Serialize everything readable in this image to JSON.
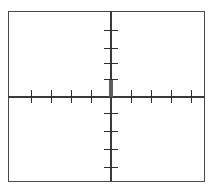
{
  "figure": {
    "kind": "cartesian-coordinate-plane",
    "width": 214,
    "height": 191,
    "background_color": "#ffffff",
    "frame_color": "#4a4a4a",
    "axis_color": "#3a3a3a",
    "tick_color": "#2e2e2e",
    "emphasis_color": "#5d5d5d",
    "title": "",
    "xlabel": "",
    "ylabel": ""
  },
  "chart_data": {
    "type": "scatter",
    "title": "",
    "subtitle": "",
    "xlabel": "",
    "ylabel": "",
    "grid": false,
    "legend": null,
    "legend_position": "none",
    "xlim": [
      -5,
      5
    ],
    "ylim": [
      -5,
      5
    ],
    "x_ticks": [
      -4,
      -3,
      -2,
      -1,
      1,
      2,
      3,
      4
    ],
    "y_ticks": [
      -4,
      -3,
      -2,
      -1,
      1,
      2,
      3,
      4
    ],
    "x_tick_labels": [
      "",
      "",
      "",
      "",
      "",
      "",
      "",
      ""
    ],
    "y_tick_labels": [
      "",
      "",
      "",
      "",
      "",
      "",
      "",
      ""
    ],
    "series": [
      {
        "name": "segment",
        "x": [
          0,
          0
        ],
        "y": [
          0,
          0.9
        ]
      }
    ],
    "annotations": [
      {
        "text": "",
        "x": 0,
        "y": 0.45,
        "note": "thickened vertical segment on positive y-axis from origin"
      }
    ]
  },
  "axes": {
    "x_axis": {
      "label": "x-axis",
      "position_y": 96,
      "start_x": 8,
      "end_x": 205,
      "ticks": [
        {
          "id": "x-neg-4",
          "left": 31
        },
        {
          "id": "x-neg-3",
          "left": 51
        },
        {
          "id": "x-neg-2",
          "left": 71
        },
        {
          "id": "x-neg-1",
          "left": 91
        },
        {
          "id": "x-pos-1",
          "left": 131
        },
        {
          "id": "x-pos-2",
          "left": 151
        },
        {
          "id": "x-pos-3",
          "left": 171
        },
        {
          "id": "x-pos-4",
          "left": 191
        }
      ]
    },
    "y_axis": {
      "label": "y-axis",
      "position_x": 110,
      "start_y": 11,
      "end_y": 182,
      "ticks": [
        {
          "id": "y-pos-4",
          "top": 30
        },
        {
          "id": "y-pos-3",
          "top": 48
        },
        {
          "id": "y-pos-2",
          "top": 63
        },
        {
          "id": "y-pos-1",
          "top": 79
        },
        {
          "id": "y-neg-1",
          "top": 113
        },
        {
          "id": "y-neg-2",
          "top": 131
        },
        {
          "id": "y-neg-3",
          "top": 149
        },
        {
          "id": "y-neg-4",
          "top": 167
        }
      ]
    }
  },
  "origin": {
    "x": 110,
    "y": 96,
    "label": ""
  }
}
